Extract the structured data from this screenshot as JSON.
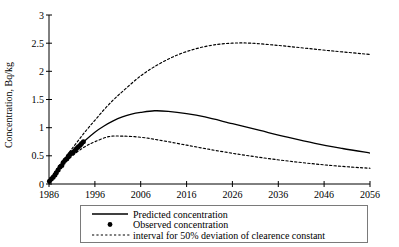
{
  "chart_data": {
    "type": "line",
    "title": "",
    "xlabel": "",
    "ylabel": "Concentration, Bq/kg",
    "xlim": [
      1986,
      2056
    ],
    "ylim": [
      0,
      3
    ],
    "xticks": [
      "1986",
      "1996",
      "2006",
      "2016",
      "2026",
      "2036",
      "2046",
      "2056"
    ],
    "xtick_values": [
      1986,
      1996,
      2006,
      2016,
      2026,
      2036,
      2046,
      2056
    ],
    "yticks": [
      "0",
      "0.5",
      "1",
      "1.5",
      "2",
      "2.5",
      "3"
    ],
    "ytick_values": [
      0,
      0.5,
      1,
      1.5,
      2,
      2.5,
      3
    ],
    "grid": false,
    "legend_position": "below-axes",
    "series": [
      {
        "name": "Predicted concentration",
        "style": "solid",
        "x": [
          1986,
          1988,
          1990,
          1992,
          1994,
          1996,
          1998,
          2000,
          2002,
          2004,
          2006,
          2009,
          2012,
          2016,
          2020,
          2026,
          2032,
          2038,
          2044,
          2050,
          2056
        ],
        "values": [
          0.05,
          0.28,
          0.46,
          0.62,
          0.78,
          0.92,
          1.03,
          1.12,
          1.19,
          1.24,
          1.27,
          1.3,
          1.29,
          1.25,
          1.19,
          1.07,
          0.95,
          0.83,
          0.72,
          0.63,
          0.55
        ]
      },
      {
        "name": "interval for 50% deviation of clearence constant",
        "style": "dotted",
        "bound": "upper",
        "x": [
          1986,
          1988,
          1990,
          1992,
          1994,
          1996,
          1998,
          2000,
          2002,
          2006,
          2010,
          2014,
          2018,
          2022,
          2026,
          2030,
          2036,
          2042,
          2048,
          2056
        ],
        "values": [
          0.05,
          0.3,
          0.52,
          0.73,
          0.94,
          1.13,
          1.32,
          1.49,
          1.64,
          1.92,
          2.13,
          2.29,
          2.4,
          2.47,
          2.5,
          2.5,
          2.46,
          2.41,
          2.36,
          2.3
        ]
      },
      {
        "name": "interval for 50% deviation of clearence constant",
        "style": "dotted",
        "bound": "lower",
        "x": [
          1986,
          1988,
          1990,
          1992,
          1994,
          1996,
          1999,
          2002,
          2006,
          2010,
          2016,
          2022,
          2028,
          2034,
          2040,
          2046,
          2052,
          2056
        ],
        "values": [
          0.05,
          0.26,
          0.42,
          0.56,
          0.67,
          0.75,
          0.84,
          0.85,
          0.83,
          0.78,
          0.69,
          0.6,
          0.52,
          0.45,
          0.39,
          0.34,
          0.3,
          0.28
        ]
      },
      {
        "name": "Observed concentration",
        "style": "points",
        "x": [
          1986.1,
          1986.5,
          1986.9,
          1987.3,
          1987.6,
          1988.0,
          1988.4,
          1988.8,
          1989.1,
          1989.5,
          1989.9,
          1990.2,
          1990.6,
          1991.0,
          1991.3,
          1991.7,
          1992.0,
          1992.4,
          1992.8,
          1993.1,
          1993.5
        ],
        "values": [
          0.05,
          0.09,
          0.12,
          0.16,
          0.2,
          0.25,
          0.3,
          0.33,
          0.38,
          0.42,
          0.45,
          0.49,
          0.53,
          0.55,
          0.57,
          0.6,
          0.63,
          0.66,
          0.69,
          0.72,
          0.75
        ]
      }
    ]
  },
  "legend": {
    "items": [
      {
        "label": "Predicted concentration",
        "marker": "solid-line"
      },
      {
        "label": "Observed concentration",
        "marker": "dot"
      },
      {
        "label": "interval for 50% deviation of clearence constant",
        "marker": "dotted-line"
      }
    ]
  },
  "colors": {
    "line": "#000000",
    "background": "#ffffff",
    "legend_border": "#7a7a7a"
  }
}
